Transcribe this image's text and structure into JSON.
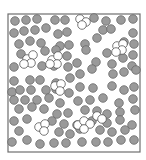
{
  "diagram": {
    "type": "particles-in-box",
    "box": {
      "x": 8,
      "y": 14,
      "width": 132,
      "height": 138,
      "stroke": "#6e6e6e"
    },
    "colors": {
      "filled_particle": "#9a9a9a",
      "filled_outline": "#6a6a6a",
      "open_particle": "#ffffff",
      "open_outline": "#555555"
    },
    "particle_radius": 4.3,
    "filled_particles": [
      [
        15,
        21
      ],
      [
        26,
        20
      ],
      [
        37,
        19
      ],
      [
        55,
        20
      ],
      [
        65,
        20
      ],
      [
        94,
        18
      ],
      [
        106,
        21
      ],
      [
        121,
        20
      ],
      [
        133,
        19
      ],
      [
        14,
        33
      ],
      [
        24,
        31
      ],
      [
        35,
        30
      ],
      [
        46,
        28
      ],
      [
        58,
        34
      ],
      [
        67,
        32
      ],
      [
        103,
        30
      ],
      [
        111,
        29
      ],
      [
        133,
        33
      ],
      [
        19,
        44
      ],
      [
        30,
        41
      ],
      [
        41,
        43
      ],
      [
        60,
        46
      ],
      [
        69,
        45
      ],
      [
        85,
        44
      ],
      [
        97,
        38
      ],
      [
        124,
        42
      ],
      [
        134,
        44
      ],
      [
        21,
        54
      ],
      [
        45,
        51
      ],
      [
        56,
        50
      ],
      [
        67,
        56
      ],
      [
        86,
        50
      ],
      [
        107,
        53
      ],
      [
        133,
        55
      ],
      [
        14,
        67
      ],
      [
        42,
        66
      ],
      [
        54,
        66
      ],
      [
        68,
        67
      ],
      [
        77,
        63
      ],
      [
        96,
        62
      ],
      [
        112,
        64
      ],
      [
        123,
        58
      ],
      [
        132,
        66
      ],
      [
        14,
        81
      ],
      [
        30,
        80
      ],
      [
        40,
        80
      ],
      [
        56,
        83
      ],
      [
        70,
        78
      ],
      [
        80,
        74
      ],
      [
        92,
        69
      ],
      [
        113,
        74
      ],
      [
        124,
        72
      ],
      [
        136,
        70
      ],
      [
        12,
        92
      ],
      [
        20,
        90
      ],
      [
        31,
        90
      ],
      [
        46,
        90
      ],
      [
        56,
        89
      ],
      [
        69,
        93
      ],
      [
        80,
        87
      ],
      [
        93,
        88
      ],
      [
        112,
        86
      ],
      [
        124,
        90
      ],
      [
        134,
        87
      ],
      [
        14,
        100
      ],
      [
        25,
        100
      ],
      [
        37,
        100
      ],
      [
        49,
        98
      ],
      [
        60,
        103
      ],
      [
        78,
        101
      ],
      [
        90,
        100
      ],
      [
        103,
        98
      ],
      [
        119,
        103
      ],
      [
        133,
        99
      ],
      [
        19,
        109
      ],
      [
        32,
        107
      ],
      [
        44,
        109
      ],
      [
        57,
        114
      ],
      [
        68,
        113
      ],
      [
        85,
        110
      ],
      [
        97,
        111
      ],
      [
        107,
        114
      ],
      [
        120,
        112
      ],
      [
        135,
        110
      ],
      [
        14,
        121
      ],
      [
        27,
        119
      ],
      [
        52,
        121
      ],
      [
        64,
        124
      ],
      [
        77,
        125
      ],
      [
        92,
        121
      ],
      [
        107,
        123
      ],
      [
        120,
        120
      ],
      [
        132,
        125
      ],
      [
        19,
        131
      ],
      [
        42,
        128
      ],
      [
        59,
        132
      ],
      [
        70,
        134
      ],
      [
        80,
        129
      ],
      [
        100,
        130
      ],
      [
        112,
        132
      ],
      [
        125,
        130
      ],
      [
        12,
        142
      ],
      [
        27,
        140
      ],
      [
        40,
        144
      ],
      [
        54,
        143
      ],
      [
        66,
        143
      ],
      [
        82,
        142
      ],
      [
        96,
        142
      ],
      [
        108,
        142
      ],
      [
        121,
        140
      ],
      [
        134,
        140
      ]
    ],
    "open_clusters": [
      [
        [
          27,
          59
        ],
        [
          33,
          55
        ],
        [
          31,
          63
        ],
        [
          24,
          64
        ]
      ],
      [
        [
          52,
          60
        ],
        [
          58,
          56
        ],
        [
          57,
          64
        ],
        [
          50,
          64
        ]
      ],
      [
        [
          80,
          19
        ],
        [
          86,
          22
        ],
        [
          82,
          25
        ]
      ],
      [
        [
          117,
          46
        ],
        [
          123,
          44
        ],
        [
          122,
          50
        ],
        [
          116,
          52
        ]
      ],
      [
        [
          55,
          86
        ],
        [
          61,
          84
        ],
        [
          60,
          91
        ]
      ],
      [
        [
          39,
          127
        ],
        [
          45,
          124
        ],
        [
          44,
          131
        ]
      ],
      [
        [
          78,
          125
        ],
        [
          84,
          121
        ],
        [
          90,
          124
        ],
        [
          84,
          129
        ]
      ],
      [
        [
          97,
          116
        ],
        [
          102,
          119
        ]
      ]
    ]
  }
}
